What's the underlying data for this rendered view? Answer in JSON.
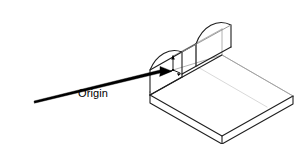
{
  "figure": {
    "type": "isometric-technical-drawing",
    "background_color": "#ffffff",
    "line_color_outline": "#1a1a1a",
    "line_color_interior": "#9a9a9a",
    "arrow_color": "#000000",
    "annotation": {
      "label": "Origin",
      "label_color": "#000000",
      "label_font_size_px": 11,
      "leader_arrow": {
        "from_x": 105,
        "from_y": 86,
        "to_x": 172,
        "to_y": 70,
        "style": "tapered-solid"
      }
    },
    "origin_marker": {
      "x": 173,
      "y": 70,
      "axes": [
        "z-up",
        "x-right",
        "y-left"
      ],
      "color": "#000000"
    },
    "geometry": {
      "arch_front_face": {
        "base_left_x": 150,
        "base_left_y": 92,
        "base_right_x": 182,
        "base_right_y": 74,
        "apex_x": 163,
        "apex_y": 40
      },
      "arch_back_face": {
        "base_left_x": 196,
        "base_left_y": 66,
        "base_right_x": 231,
        "base_right_y": 47,
        "apex_x": 212,
        "apex_y": 10
      },
      "base_plate": {
        "near_left_x": 150,
        "near_left_y": 95,
        "near_right_x": 222,
        "near_right_y": 136,
        "far_right_x": 293,
        "far_right_y": 96,
        "thickness_px": 8
      }
    }
  }
}
